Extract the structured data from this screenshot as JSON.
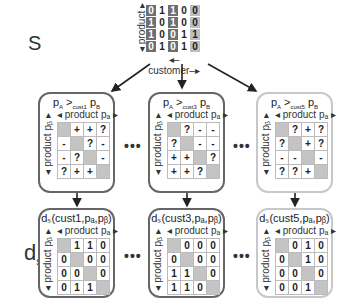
{
  "labels": {
    "s": "S",
    "d": "d",
    "d_sub": "s"
  },
  "s_matrix": {
    "x_axis": "customer",
    "y_axis": "product",
    "column_shades": [
      "dark",
      "white",
      "dark",
      "white",
      "light"
    ],
    "rows": [
      [
        "0",
        "1",
        "1",
        "0",
        "0"
      ],
      [
        "1",
        "0",
        "1",
        "0",
        "0"
      ],
      [
        "1",
        "0",
        "0",
        "1",
        "1"
      ],
      [
        "0",
        "1",
        "0",
        "1",
        "0"
      ]
    ]
  },
  "preference_boxes": [
    {
      "title_a": "p",
      "sub_a": "A",
      "op": " >",
      "cust": "cust1",
      "title_b": " p",
      "sub_b": "B",
      "header": "◂ product pₐ ▸",
      "ylabel": "◂ product pᵦ ▸",
      "cells": [
        [
          "",
          "+",
          "+",
          "?"
        ],
        [
          "-",
          "",
          "?",
          "-"
        ],
        [
          "-",
          "?",
          "",
          "-"
        ],
        [
          "?",
          "+",
          "+",
          ""
        ]
      ],
      "style": "dark"
    },
    {
      "title_a": "p",
      "sub_a": "A",
      "op": " >",
      "cust": "cust3",
      "title_b": " p",
      "sub_b": "B",
      "header": "◂ product pₐ ▸",
      "ylabel": "◂ product pᵦ ▸",
      "cells": [
        [
          "",
          "?",
          "-",
          "-"
        ],
        [
          "?",
          "",
          "-",
          "-"
        ],
        [
          "+",
          "+",
          "",
          "?"
        ],
        [
          "+",
          "+",
          "?",
          ""
        ]
      ],
      "style": "dark"
    },
    {
      "title_a": "p",
      "sub_a": "A",
      "op": " >",
      "cust": "cust5",
      "title_b": " p",
      "sub_b": "B",
      "header": "◂ product pₐ ▸",
      "ylabel": "◂ product pᵦ ▸",
      "cells": [
        [
          "",
          "?",
          "+",
          "?"
        ],
        [
          "?",
          "",
          "+",
          "?"
        ],
        [
          "-",
          "-",
          "",
          "-"
        ],
        [
          "?",
          "?",
          "+",
          ""
        ]
      ],
      "style": "light"
    }
  ],
  "distance_boxes": [
    {
      "title": "dₛ(cust1,pₐ,pᵦ)",
      "header": "◂ product pₐ ▸",
      "ylabel": "◂ product pᵦ ▸",
      "cells": [
        [
          "",
          "1",
          "1",
          "0"
        ],
        [
          "0",
          "",
          "0",
          "0"
        ],
        [
          "0",
          "0",
          "",
          "0"
        ],
        [
          "0",
          "1",
          "1",
          ""
        ]
      ],
      "style": "dark"
    },
    {
      "title": "dₛ(cust3,pₐ,pᵦ)",
      "header": "◂ product pₐ ▸",
      "ylabel": "◂ product pᵦ ▸",
      "cells": [
        [
          "",
          "0",
          "0",
          "0"
        ],
        [
          "0",
          "",
          "0",
          "0"
        ],
        [
          "1",
          "1",
          "",
          "0"
        ],
        [
          "1",
          "1",
          "0",
          ""
        ]
      ],
      "style": "dark"
    },
    {
      "title": "dₛ(cust5,pₐ,pᵦ)",
      "header": "◂ product pₐ ▸",
      "ylabel": "◂ product pᵦ ▸",
      "cells": [
        [
          "",
          "0",
          "1",
          "0"
        ],
        [
          "0",
          "",
          "1",
          "0"
        ],
        [
          "0",
          "0",
          "",
          "0"
        ],
        [
          "0",
          "0",
          "1",
          ""
        ]
      ],
      "style": "light"
    }
  ],
  "ellipsis": "•••"
}
